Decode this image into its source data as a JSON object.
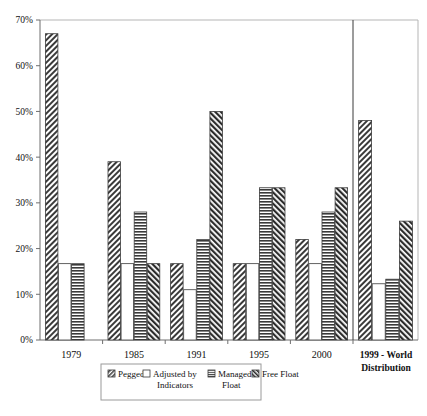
{
  "chart_data": {
    "type": "bar",
    "title": "",
    "subtitle": "",
    "xlabel": "",
    "ylabel": "",
    "ylim": [
      0,
      70
    ],
    "ytick_labels": [
      "0%",
      "10%",
      "20%",
      "30%",
      "40%",
      "50%",
      "60%",
      "70%"
    ],
    "ytick_values": [
      0,
      10,
      20,
      30,
      40,
      50,
      60,
      70
    ],
    "grid": false,
    "legend_position": "bottom",
    "categories": [
      "1979",
      "1985",
      "1991",
      "1995",
      "2000",
      "1999 - World Distribution"
    ],
    "series": [
      {
        "name": "Pegged",
        "pattern": "diagonal-hatch",
        "values": [
          67.0,
          39.0,
          16.7,
          16.7,
          22.0,
          48.0
        ]
      },
      {
        "name": "Adjusted by Indicators",
        "pattern": "empty-white",
        "values": [
          16.7,
          16.7,
          11.0,
          16.7,
          16.7,
          12.3
        ]
      },
      {
        "name": "Managed Float",
        "pattern": "horizontal-lines",
        "values": [
          16.7,
          28.0,
          22.0,
          33.3,
          28.0,
          13.3
        ]
      },
      {
        "name": "Free Float",
        "pattern": "reverse-diagonal-hatch",
        "values": [
          0.0,
          16.7,
          50.0,
          33.3,
          33.3,
          26.0
        ]
      }
    ],
    "notes": {
      "separator_before_last_group": true,
      "last_group_label_lines": [
        "1999 - World",
        "Distribution"
      ]
    }
  },
  "legend": {
    "items": [
      {
        "label": "Pegged",
        "swatch": "diagonal-hatch-swatch"
      },
      {
        "label_line1": "Adjusted by",
        "label_line2": "Indicators",
        "swatch": "empty-white-swatch"
      },
      {
        "label_line1": "Managed",
        "label_line2": "Float",
        "swatch": "horizontal-lines-swatch"
      },
      {
        "label": "Free Float",
        "swatch": "reverse-diagonal-hatch-swatch"
      }
    ]
  },
  "axis": {
    "y_labels": [
      "70%",
      "60%",
      "50%",
      "40%",
      "30%",
      "20%",
      "10%",
      "0%"
    ],
    "x_labels": [
      "1979",
      "1985",
      "1991",
      "1995",
      "2000"
    ],
    "panel_label_line1": "1999 - World",
    "panel_label_line2": "Distribution"
  },
  "colors": {
    "axis": "#6f6f6f",
    "frame": "#b5b5b5",
    "bar_stroke": "#3c3c3c",
    "hatch": "#2f2f2f",
    "background": "#ffffff"
  }
}
